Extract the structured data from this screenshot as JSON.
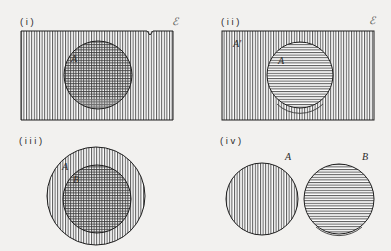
{
  "figure": {
    "background_color": "#f2f1ef",
    "ink_color": "#1e1e1e",
    "hatch_color": "#6b6b6b"
  },
  "panels": [
    {
      "id": "panel-i",
      "number": "( i )",
      "universe_symbol": "ℰ",
      "shapes": [
        {
          "name": "universe-rectangle",
          "fill": "vertical-hatch"
        },
        {
          "name": "set-a-circle",
          "label": "A",
          "fill": "cross-hatch"
        }
      ]
    },
    {
      "id": "panel-ii",
      "number": "( i i )",
      "universe_symbol": "ℰ",
      "shapes": [
        {
          "name": "universe-rectangle",
          "label": "A'",
          "fill": "vertical-hatch"
        },
        {
          "name": "set-a-circle",
          "label": "A",
          "fill": "horizontal-hatch"
        }
      ]
    },
    {
      "id": "panel-iii",
      "number": "( i i i )",
      "universe_symbol": "",
      "shapes": [
        {
          "name": "set-a-circle",
          "label": "A",
          "fill": "vertical-hatch"
        },
        {
          "name": "set-b-circle",
          "label": "B",
          "fill": "cross-hatch"
        }
      ]
    },
    {
      "id": "panel-iv",
      "number": "( i v )",
      "universe_symbol": "",
      "shapes": [
        {
          "name": "set-a-circle",
          "label": "A",
          "fill": "vertical-hatch"
        },
        {
          "name": "set-b-circle",
          "label": "B",
          "fill": "horizontal-hatch"
        }
      ]
    }
  ],
  "labels": {
    "panel_i_number": "( i )",
    "panel_ii_number": "( i i )",
    "panel_iii_number": "( i i i )",
    "panel_iv_number": "( i v )",
    "panel_i_universe": "ℰ",
    "panel_ii_universe": "ℰ",
    "panel_i_set_a": "A",
    "panel_ii_complement": "A'",
    "panel_ii_set_a": "A",
    "panel_iii_set_a": "A",
    "panel_iii_set_b": "B",
    "panel_iv_set_a": "A",
    "panel_iv_set_b": "B"
  }
}
